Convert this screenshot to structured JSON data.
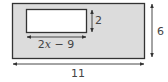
{
  "diagram": {
    "outer_rect": {
      "fill": "#dcdcdc",
      "stroke": "#333333"
    },
    "inner_rect": {
      "fill": "#ffffff",
      "stroke": "#333333"
    },
    "labels": {
      "inner_height": "2",
      "inner_width_pre": "2",
      "inner_width_var": "x",
      "inner_width_post": " − 9",
      "outer_height": "6",
      "outer_width": "11"
    }
  }
}
